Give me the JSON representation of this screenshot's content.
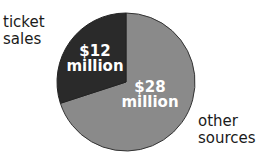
{
  "chart_data": {
    "type": "pie",
    "title": "",
    "categories": [
      "ticket sales",
      "other sources"
    ],
    "values": [
      12,
      28
    ],
    "units": "$ million",
    "slices": [
      {
        "label": "ticket sales",
        "value": 12,
        "value_label_line1": "$12",
        "value_label_line2": "million",
        "color": "#2a2a2a"
      },
      {
        "label": "other sources",
        "value": 28,
        "value_label_line1": "$28",
        "value_label_line2": "million",
        "color": "#8a8a8a"
      }
    ],
    "legend": "none",
    "start_angle_deg": 0,
    "direction": "counterclockwise"
  },
  "labels": {
    "ticket_line1": "ticket",
    "ticket_line2": "sales",
    "other_line1": "other",
    "other_line2": "sources"
  }
}
